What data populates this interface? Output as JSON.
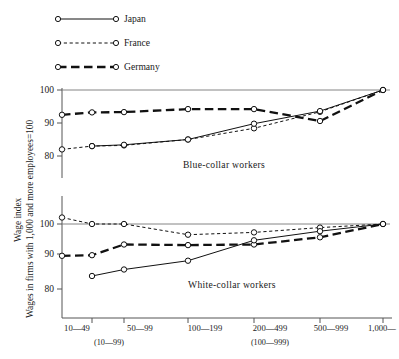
{
  "chart_data": {
    "type": "line",
    "title": "",
    "ylabel_primary": "Wage index",
    "ylabel_secondary": "Wages in firms with 1,000 and more employees=100",
    "xlabel": "",
    "categories": [
      "10—49",
      "50—99",
      "100—199",
      "200—499",
      "500—999",
      "1,000—"
    ],
    "categories_alt": [
      "(10—99)",
      "(100—999)"
    ],
    "categories_alt_positions": [
      1,
      3
    ],
    "legend": [
      "Japan",
      "France",
      "Germany"
    ],
    "legend_position": "top-left",
    "grid": false,
    "panels": [
      {
        "name": "blue-collar",
        "label": "Blue-collar workers",
        "ylim": [
          74,
          102
        ],
        "yticks": [
          80,
          90,
          100
        ],
        "gridline_at": 100,
        "series": [
          {
            "name": "Japan",
            "x": [
              1,
              2,
              3,
              4,
              5,
              6
            ],
            "values": [
              83.0,
              83.4,
              85.0,
              89.8,
              93.6,
              100.0
            ]
          },
          {
            "name": "France",
            "x": [
              0,
              1,
              2,
              3,
              4,
              5,
              6
            ],
            "values": [
              82.0,
              83.0,
              83.2,
              85.0,
              88.4,
              93.4,
              100.0
            ]
          },
          {
            "name": "Germany",
            "x": [
              0,
              1,
              2,
              3,
              4,
              5,
              6
            ],
            "values": [
              92.5,
              93.2,
              93.3,
              94.2,
              94.2,
              90.6,
              100.0
            ]
          }
        ]
      },
      {
        "name": "white-collar",
        "label": "White-collar workers",
        "ylim": [
          72,
          106
        ],
        "yticks": [
          80,
          90,
          100
        ],
        "gridline_at": 100,
        "series": [
          {
            "name": "Japan",
            "x": [
              1,
              2,
              3,
              4,
              5,
              6
            ],
            "values": [
              84.0,
              86.0,
              88.7,
              95.0,
              97.8,
              100.0
            ]
          },
          {
            "name": "France",
            "x": [
              0,
              1,
              2,
              3,
              4,
              5,
              6
            ],
            "values": [
              102.0,
              100.0,
              100.0,
              96.7,
              97.4,
              98.9,
              100.0
            ]
          },
          {
            "name": "Germany",
            "x": [
              0,
              1,
              2,
              3,
              4,
              5,
              6
            ],
            "values": [
              90.2,
              90.4,
              93.7,
              93.5,
              93.7,
              95.9,
              100.0
            ]
          }
        ]
      }
    ]
  },
  "legend": {
    "items": [
      {
        "label": "Japan",
        "style": "solid"
      },
      {
        "label": "France",
        "style": "dotted"
      },
      {
        "label": "Germany",
        "style": "dashed"
      }
    ]
  },
  "axis": {
    "y_title_1": "Wage index",
    "y_title_2": "Wages in firms with 1,000 and more employees=100"
  },
  "panels": {
    "top_label": "Blue-collar workers",
    "bottom_label": "White-collar workers"
  },
  "xaxis": {
    "ticks": [
      "10—49",
      "50—99",
      "100—199",
      "200—499",
      "500—999",
      "1,000—"
    ],
    "subticks": [
      "(10—99)",
      "(100—999)"
    ]
  },
  "yaxis": {
    "top_ticks": [
      "100",
      "90",
      "80"
    ],
    "bottom_ticks": [
      "100",
      "90",
      "80"
    ]
  }
}
